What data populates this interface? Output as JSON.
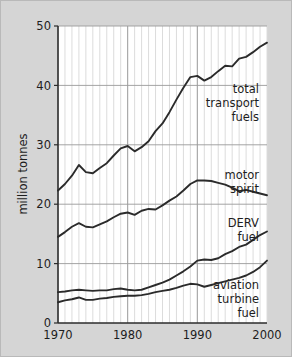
{
  "chart_data": {
    "type": "line",
    "title": "",
    "xlabel": "",
    "ylabel": "million tonnes",
    "xlim": [
      1970,
      2000
    ],
    "ylim": [
      0,
      50
    ],
    "xticks": [
      "1970",
      "1980",
      "1990",
      "2000"
    ],
    "yticks": [
      "0",
      "10",
      "20",
      "30",
      "40",
      "50"
    ],
    "grid": "vertical yearly minor lines, horizontal lines at every y tick",
    "legend": "inline labels at right of each series",
    "x": [
      1970,
      1971,
      1972,
      1973,
      1974,
      1975,
      1976,
      1977,
      1978,
      1979,
      1980,
      1981,
      1982,
      1983,
      1984,
      1985,
      1986,
      1987,
      1988,
      1989,
      1990,
      1991,
      1992,
      1993,
      1994,
      1995,
      1996,
      1997,
      1998,
      1999,
      2000
    ],
    "series": [
      {
        "name": "total transport fuels",
        "label_lines": [
          "total",
          "transport",
          "fuels"
        ],
        "values": [
          22.3,
          23.4,
          24.8,
          26.6,
          25.4,
          25.2,
          26.1,
          26.9,
          28.2,
          29.4,
          29.8,
          28.9,
          29.6,
          30.6,
          32.3,
          33.6,
          35.5,
          37.6,
          39.6,
          41.4,
          41.6,
          40.8,
          41.4,
          42.4,
          43.3,
          43.2,
          44.5,
          44.8,
          45.6,
          46.5,
          47.2
        ]
      },
      {
        "name": "motor spirit",
        "label_lines": [
          "motor",
          "spirit"
        ],
        "values": [
          14.5,
          15.3,
          16.2,
          16.8,
          16.2,
          16.1,
          16.6,
          17.1,
          17.8,
          18.4,
          18.6,
          18.2,
          18.9,
          19.2,
          19.1,
          19.8,
          20.6,
          21.3,
          22.3,
          23.4,
          24.0,
          24.0,
          23.9,
          23.6,
          23.3,
          22.8,
          22.2,
          22.4,
          22.1,
          21.8,
          21.5
        ]
      },
      {
        "name": "DERV fuel",
        "label_lines": [
          "DERV",
          "fuel"
        ],
        "values": [
          5.2,
          5.3,
          5.5,
          5.6,
          5.5,
          5.4,
          5.5,
          5.5,
          5.7,
          5.8,
          5.6,
          5.5,
          5.6,
          6.0,
          6.4,
          6.8,
          7.3,
          8.0,
          8.7,
          9.5,
          10.5,
          10.7,
          10.6,
          10.9,
          11.6,
          12.1,
          12.8,
          13.2,
          14.0,
          14.8,
          15.4
        ]
      },
      {
        "name": "aviation turbine fuel",
        "label_lines": [
          "aviation",
          "turbine",
          "fuel"
        ],
        "values": [
          3.5,
          3.8,
          4.0,
          4.3,
          3.9,
          3.9,
          4.1,
          4.2,
          4.4,
          4.5,
          4.6,
          4.6,
          4.7,
          4.9,
          5.2,
          5.4,
          5.6,
          5.9,
          6.3,
          6.6,
          6.5,
          6.1,
          6.4,
          6.7,
          7.0,
          7.3,
          7.6,
          8.0,
          8.6,
          9.4,
          10.5
        ]
      }
    ]
  },
  "colors": {
    "page_background": "#d5d5d5",
    "plot_background": "#ffffff",
    "line": "#2b2b2b",
    "gridline_minor": "#dcdcdc",
    "gridline_major": "#9a9a9a",
    "axis": "#2b2b2b",
    "text": "#1d1d1d"
  }
}
